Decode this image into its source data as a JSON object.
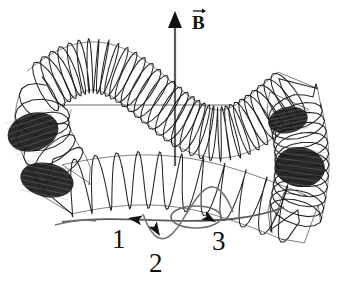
{
  "figure": {
    "background_color": "#ffffff",
    "ink_color": "#111111",
    "shade_color": "#1a1a1a",
    "guide_color": "#555555",
    "canvas": {
      "width": 346,
      "height": 290
    }
  },
  "field": {
    "vector_label": "B",
    "vector_symbol": "vector-arrow-overline",
    "arrow_name": "magnetic-field-arrow",
    "arrow_direction": "up",
    "arrow_x": 175,
    "arrow_tip_y": 11,
    "arrow_base_y": 166,
    "label_x": 192,
    "label_y": 13
  },
  "guide_line": {
    "name": "horizontal-reference-line",
    "y": 105,
    "x_start": 62,
    "x_end": 232,
    "color": "#6a6a6a"
  },
  "helix": {
    "name": "helical-coil",
    "description": "coil wound around a sinusoidal guide path forming a closed loop",
    "turn_count": 64,
    "stroke_color": "#141414",
    "shaded_regions": [
      "upper-left-end",
      "right-side",
      "lower-left",
      "bottom-right"
    ]
  },
  "trajectory": {
    "name": "particle-path",
    "color": "#5a5a5a",
    "loop": {
      "name": "center-crossing-loop",
      "cx": 196,
      "cy": 217,
      "rx": 25,
      "ry": 11
    }
  },
  "markers": [
    {
      "id": "marker-1",
      "label": "1",
      "label_x": 112,
      "label_y": 226,
      "arrow_x": 128,
      "arrow_y": 218,
      "arrow_rotation": -170
    },
    {
      "id": "marker-2",
      "label": "2",
      "label_x": 149,
      "label_y": 250,
      "arrow_x": 160,
      "arrow_y": 236,
      "arrow_rotation": 58
    },
    {
      "id": "marker-3",
      "label": "3",
      "label_x": 212,
      "label_y": 228,
      "arrow_x": 216,
      "arrow_y": 222,
      "arrow_rotation": 28
    }
  ]
}
